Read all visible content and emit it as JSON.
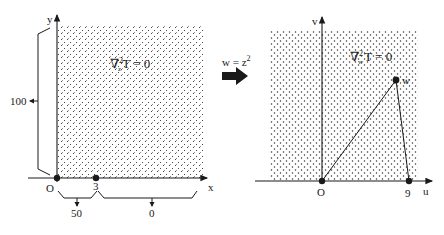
{
  "left_panel": {
    "x_axis_label": "x",
    "y_axis_label": "y",
    "origin_label": "O",
    "point_label": "3",
    "equation": {
      "operator": "∇",
      "superscript": "2",
      "subscript": "z",
      "body": "T = 0"
    },
    "boundary_values": {
      "left_edge": "100",
      "bottom_origin_to_3": "50",
      "bottom_beyond_3": "0"
    }
  },
  "mapping": {
    "label_prefix": "w = z",
    "label_exponent": "2"
  },
  "right_panel": {
    "u_axis_label": "u",
    "v_axis_label": "v",
    "origin_label": "O",
    "point_label": "9",
    "vertex_label": "w",
    "equation": {
      "operator": "∇",
      "superscript": "2",
      "subscript": "w",
      "body": "T = 0"
    }
  },
  "colors": {
    "ink": "#1a1a1a",
    "stipple": "#333333",
    "background": "#ffffff"
  }
}
